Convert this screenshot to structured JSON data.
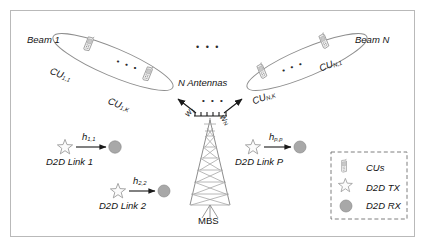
{
  "figure": {
    "frame_color": "#b9b9b9",
    "background": "#ffffff",
    "ink_color": "#141414",
    "icon_color": "#9a9a9a"
  },
  "beams": [
    {
      "name": "beam-1",
      "label": "Beam 1",
      "weight_label": "w",
      "weight_sub": "1",
      "users": [
        {
          "label": "CU",
          "sub": "1,1"
        },
        {
          "label": "CU",
          "sub": "1,K"
        }
      ],
      "inner_dots": "• • •"
    },
    {
      "name": "beam-n",
      "label": "Beam N",
      "weight_label": "w",
      "weight_sub": "N",
      "users": [
        {
          "label": "CU",
          "sub": "N,1"
        },
        {
          "label": "CU",
          "sub": "N,K"
        }
      ],
      "inner_dots": "• • •"
    }
  ],
  "beams_between_dots": "• • •",
  "base_station": {
    "antenna_label": "N Antennas",
    "antenna_dots": "• • •",
    "station_label": "MBS"
  },
  "d2d_links": [
    {
      "name": "d2d-link-1",
      "label": "D2D Link 1",
      "channel": "h",
      "channel_sub": "1,1"
    },
    {
      "name": "d2d-link-2",
      "label": "D2D Link 2",
      "channel": "h",
      "channel_sub": "2,2"
    },
    {
      "name": "d2d-link-p",
      "label": "D2D Link P",
      "channel": "h",
      "channel_sub": "p,p"
    }
  ],
  "legend": {
    "items": [
      {
        "icon": "phone-icon",
        "label": "CUs"
      },
      {
        "icon": "star-icon",
        "label": "D2D TX"
      },
      {
        "icon": "circle-icon",
        "label": "D2D RX"
      }
    ]
  }
}
